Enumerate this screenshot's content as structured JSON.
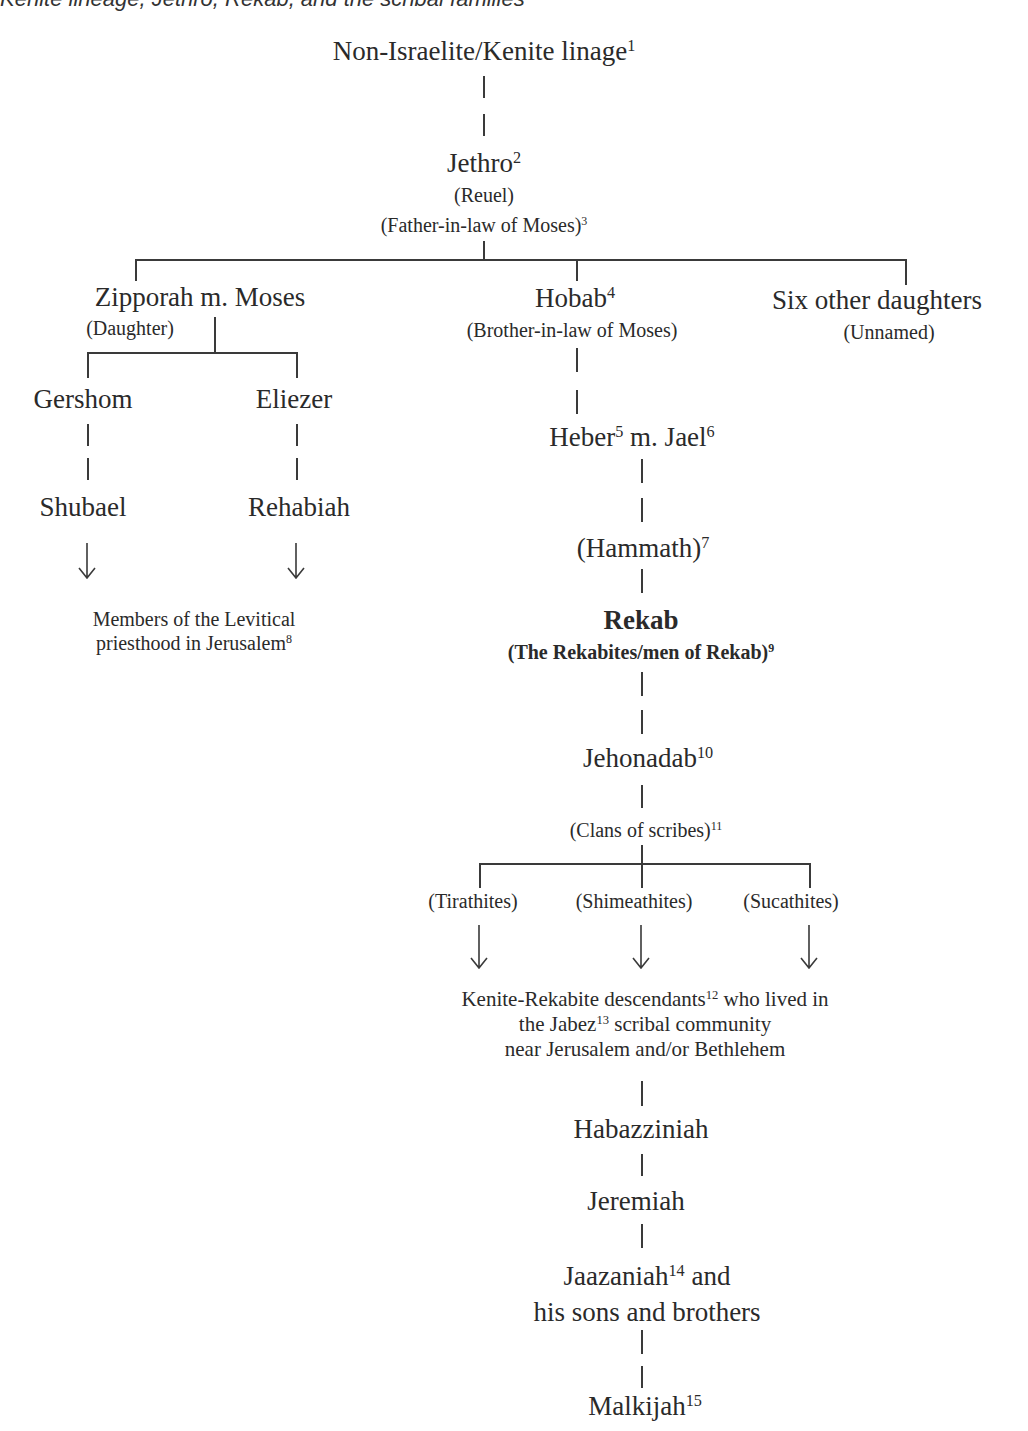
{
  "header": {
    "clipped_caption": "Kenite lineage, Jethro, Rekab, and the scribal families"
  },
  "diagram": {
    "root": {
      "label": "Non-Israelite/Kenite linage",
      "note": "1"
    },
    "jethro": {
      "label": "Jethro",
      "note": "2",
      "alias": "(Reuel)",
      "role": "(Father-in-law of Moses)",
      "role_note": "3"
    },
    "zipporah": {
      "label": "Zipporah m. Moses",
      "role": "(Daughter)"
    },
    "hobab": {
      "label": "Hobab",
      "note": "4",
      "role": "(Brother-in-law of Moses)"
    },
    "six_daughters": {
      "label": "Six other daughters",
      "role": "(Unnamed)"
    },
    "gershom": {
      "label": "Gershom"
    },
    "eliezer": {
      "label": "Eliezer"
    },
    "shubael": {
      "label": "Shubael"
    },
    "rehabiah": {
      "label": "Rehabiah"
    },
    "levitical": {
      "line1": "Members of the Levitical",
      "line2": "priesthood in Jerusalem",
      "note": "8"
    },
    "heber": {
      "label": "Heber",
      "note": "5",
      "mid": " m. Jael",
      "note2": "6"
    },
    "hammath": {
      "label": "(Hammath)",
      "note": "7"
    },
    "rekab": {
      "label": "Rekab",
      "role": "(The Rekabites/men of Rekab)",
      "note": "9"
    },
    "jehonadab": {
      "label": "Jehonadab",
      "note": "10"
    },
    "clans": {
      "label": "(Clans of scribes)",
      "note": "11"
    },
    "tirathites": {
      "label": "(Tirathites)"
    },
    "shimeathites": {
      "label": "(Shimeathites)"
    },
    "sucathites": {
      "label": "(Sucathites)"
    },
    "descendants": {
      "line1a": "Kenite-Rekabite descendants",
      "note1": "12",
      "line1b": " who lived in",
      "line2a": "the Jabez",
      "note2": "13",
      "line2b": " scribal community",
      "line3": "near Jerusalem and/or Bethlehem"
    },
    "habazziniah": {
      "label": "Habazziniah"
    },
    "jeremiah": {
      "label": "Jeremiah"
    },
    "jaazaniah": {
      "line1": "Jaazaniah",
      "note": "14",
      "line1b": " and",
      "line2": "his sons and brothers"
    },
    "malkijah": {
      "label": "Malkijah",
      "note": "15"
    }
  },
  "colors": {
    "text": "#2a2a2a",
    "lines": "#3a3a3a",
    "background": "#ffffff"
  }
}
